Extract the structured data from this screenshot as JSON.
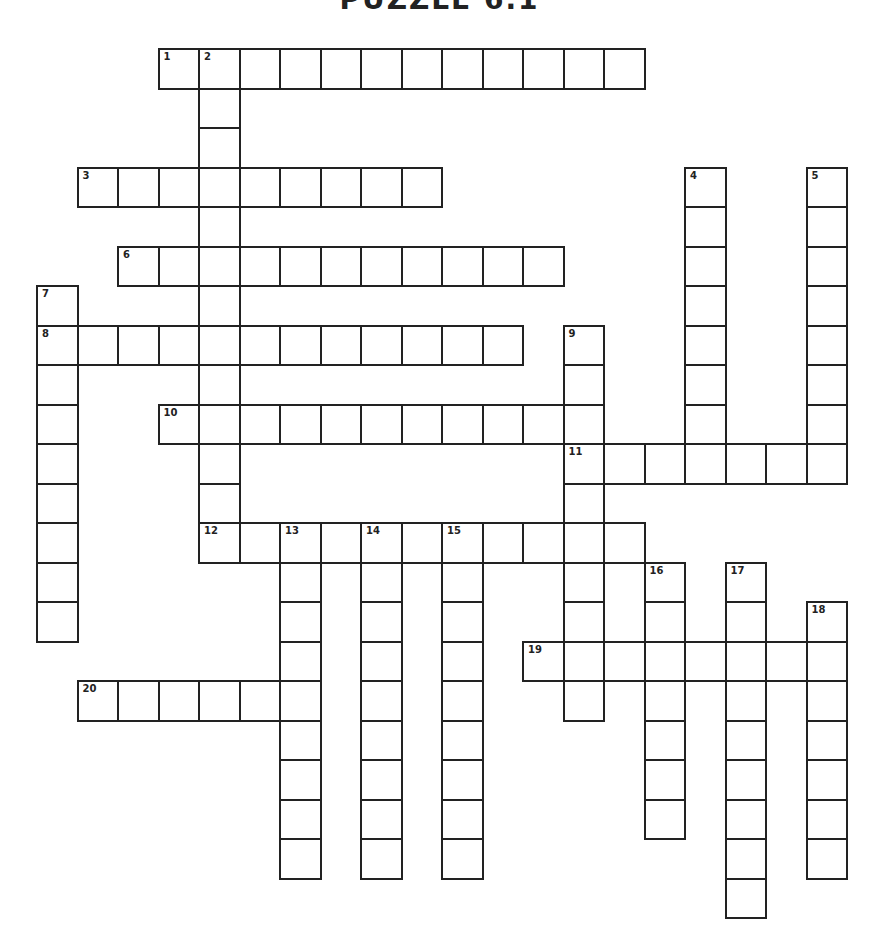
{
  "title": "PUZZLE 6.1",
  "grid": {
    "origin_x": 36,
    "origin_y": 48,
    "cell_w": 40.5,
    "cell_h": 39.5,
    "border_color": "#222222"
  },
  "entries": [
    {
      "number": 1,
      "direction": "across",
      "row": 0,
      "col": 3,
      "length": 12
    },
    {
      "number": 2,
      "direction": "down",
      "row": 0,
      "col": 4,
      "length": 13
    },
    {
      "number": 3,
      "direction": "across",
      "row": 3,
      "col": 1,
      "length": 9
    },
    {
      "number": 4,
      "direction": "down",
      "row": 3,
      "col": 16,
      "length": 8
    },
    {
      "number": 5,
      "direction": "down",
      "row": 3,
      "col": 19,
      "length": 8
    },
    {
      "number": 6,
      "direction": "across",
      "row": 5,
      "col": 2,
      "length": 11
    },
    {
      "number": 7,
      "direction": "down",
      "row": 6,
      "col": 0,
      "length": 9
    },
    {
      "number": 8,
      "direction": "across",
      "row": 7,
      "col": 0,
      "length": 12
    },
    {
      "number": 9,
      "direction": "down",
      "row": 7,
      "col": 13,
      "length": 10
    },
    {
      "number": 10,
      "direction": "across",
      "row": 9,
      "col": 3,
      "length": 11
    },
    {
      "number": 11,
      "direction": "across",
      "row": 10,
      "col": 13,
      "length": 7
    },
    {
      "number": 12,
      "direction": "across",
      "row": 12,
      "col": 4,
      "length": 11
    },
    {
      "number": 13,
      "direction": "down",
      "row": 12,
      "col": 6,
      "length": 9
    },
    {
      "number": 14,
      "direction": "down",
      "row": 12,
      "col": 8,
      "length": 9
    },
    {
      "number": 15,
      "direction": "down",
      "row": 12,
      "col": 10,
      "length": 9
    },
    {
      "number": 16,
      "direction": "down",
      "row": 13,
      "col": 15,
      "length": 7
    },
    {
      "number": 17,
      "direction": "down",
      "row": 13,
      "col": 17,
      "length": 9
    },
    {
      "number": 18,
      "direction": "down",
      "row": 14,
      "col": 19,
      "length": 7
    },
    {
      "number": 19,
      "direction": "across",
      "row": 15,
      "col": 12,
      "length": 8
    },
    {
      "number": 20,
      "direction": "across",
      "row": 16,
      "col": 1,
      "length": 6
    }
  ]
}
